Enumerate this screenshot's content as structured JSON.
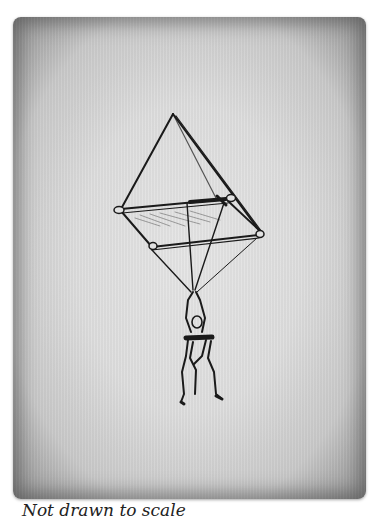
{
  "figure": {
    "caption": "Not drawn to scale"
  },
  "colors": {
    "ink": "#1a1a1a",
    "paper": "#dedede",
    "edge": "#8f8f8f"
  }
}
